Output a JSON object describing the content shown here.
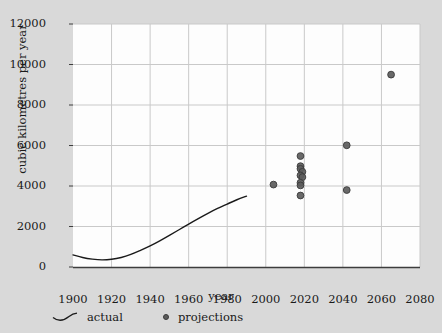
{
  "chart_data": {
    "type": "scatter",
    "title": "",
    "xlabel": "year",
    "ylabel": "cubic kilometres per year",
    "xlim": [
      1900,
      2080
    ],
    "ylim": [
      0,
      12000
    ],
    "grid": true,
    "legend_position": "bottom-left",
    "xticks": [
      1900,
      1920,
      1940,
      1960,
      1980,
      2000,
      2020,
      2040,
      2060,
      2080
    ],
    "yticks": [
      0,
      2000,
      4000,
      6000,
      8000,
      10000,
      12000
    ],
    "series": [
      {
        "name": "actual",
        "type": "line",
        "marker": "line-icon",
        "color": "#1a1a1a",
        "points": [
          {
            "x": 1900,
            "y": 600
          },
          {
            "x": 1905,
            "y": 470
          },
          {
            "x": 1910,
            "y": 390
          },
          {
            "x": 1915,
            "y": 350
          },
          {
            "x": 1920,
            "y": 380
          },
          {
            "x": 1925,
            "y": 470
          },
          {
            "x": 1930,
            "y": 620
          },
          {
            "x": 1935,
            "y": 820
          },
          {
            "x": 1940,
            "y": 1040
          },
          {
            "x": 1945,
            "y": 1290
          },
          {
            "x": 1950,
            "y": 1560
          },
          {
            "x": 1955,
            "y": 1840
          },
          {
            "x": 1960,
            "y": 2120
          },
          {
            "x": 1965,
            "y": 2390
          },
          {
            "x": 1970,
            "y": 2650
          },
          {
            "x": 1975,
            "y": 2890
          },
          {
            "x": 1980,
            "y": 3110
          },
          {
            "x": 1985,
            "y": 3320
          },
          {
            "x": 1990,
            "y": 3500
          }
        ]
      },
      {
        "name": "projections",
        "type": "scatter",
        "marker": "circle-icon",
        "color": "#5c5c5c",
        "edge_color": "#3a3a3a",
        "points": [
          {
            "x": 2004,
            "y": 4070
          },
          {
            "x": 2018,
            "y": 5480
          },
          {
            "x": 2018,
            "y": 4980
          },
          {
            "x": 2018,
            "y": 4850
          },
          {
            "x": 2019,
            "y": 4700
          },
          {
            "x": 2018,
            "y": 4520
          },
          {
            "x": 2019,
            "y": 4440
          },
          {
            "x": 2018,
            "y": 4160
          },
          {
            "x": 2018,
            "y": 4030
          },
          {
            "x": 2018,
            "y": 3530
          },
          {
            "x": 2042,
            "y": 6010
          },
          {
            "x": 2042,
            "y": 3800
          },
          {
            "x": 2065,
            "y": 9500
          }
        ]
      }
    ]
  },
  "legend": {
    "actual_label": "actual",
    "projections_label": "projections"
  },
  "colors": {
    "figure_background": "#d9d9d9",
    "plot_background": "#fdfdfd",
    "grid": "#c9c9c9",
    "axis": "#3d3d3d",
    "text": "#1a1a1a"
  }
}
